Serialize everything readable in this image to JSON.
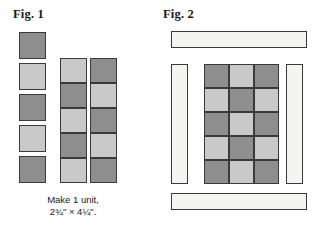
{
  "palette": {
    "dark": "#8e8e8e",
    "light": "#c9c9c9",
    "sashing": "#f4f4f2",
    "outline": "#3a3a3a",
    "background": "#ffffff",
    "text": "#1a1a1a"
  },
  "figures": [
    {
      "id": "fig1",
      "heading": "Fig. 1",
      "caption": {
        "line1": "Make 1 unit,",
        "line2": "2¾\" × 4¼\"."
      },
      "loose_squares": {
        "name": "loose-square-column",
        "count": 5,
        "shades": [
          "dark",
          "light",
          "dark",
          "light",
          "dark"
        ]
      },
      "strips": [
        {
          "name": "pieced-strip-middle",
          "cells": [
            "light",
            "dark",
            "light",
            "dark",
            "light"
          ]
        },
        {
          "name": "pieced-strip-right",
          "cells": [
            "dark",
            "light",
            "dark",
            "light",
            "dark"
          ]
        }
      ]
    },
    {
      "id": "fig2",
      "heading": "Fig. 2",
      "sashing": [
        {
          "name": "sashing-top",
          "orientation": "horizontal"
        },
        {
          "name": "sashing-left",
          "orientation": "vertical"
        },
        {
          "name": "sashing-right",
          "orientation": "vertical"
        },
        {
          "name": "sashing-bottom",
          "orientation": "horizontal"
        }
      ],
      "center_grid": {
        "name": "checkerboard-center",
        "columns": 3,
        "rows": 5,
        "cells": [
          [
            "dark",
            "light",
            "dark"
          ],
          [
            "light",
            "dark",
            "light"
          ],
          [
            "dark",
            "light",
            "dark"
          ],
          [
            "light",
            "dark",
            "light"
          ],
          [
            "dark",
            "light",
            "dark"
          ]
        ]
      }
    }
  ]
}
